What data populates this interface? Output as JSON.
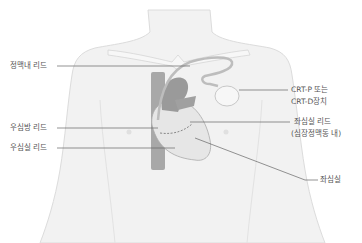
{
  "diagram": {
    "type": "anatomical-illustration",
    "colors": {
      "body_fill": "#f2f2f2",
      "body_outline": "#dcdcdc",
      "heart_fill": "#e6e6e6",
      "vessel_fill": "#a8a8a8",
      "label_text": "#555555",
      "leader_line": "#666666"
    }
  },
  "labels": {
    "svc_lead": "정맥내 리드",
    "ra_lead": "우심방 리드",
    "rv_lead": "우심실 리드",
    "device_line1": "CRT-P 또는",
    "device_line2": "CRT-D장치",
    "lv_lead_line1": "좌심실 리드",
    "lv_lead_line2": "(심장정맥동 내)",
    "lv": "좌심실"
  }
}
